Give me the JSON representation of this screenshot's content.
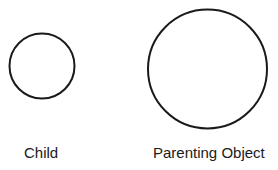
{
  "diagram": {
    "stroke_color": "#1a1a1a",
    "shapes": [
      {
        "id": "child",
        "type": "circle",
        "cx": 42,
        "cy": 66,
        "r": 32.5,
        "label": "Child"
      },
      {
        "id": "parent",
        "type": "circle",
        "cx": 207.5,
        "cy": 69,
        "r": 59.5,
        "label": "Parenting Object"
      }
    ]
  },
  "labels": {
    "child": "Child",
    "parent": "Parenting Object"
  }
}
